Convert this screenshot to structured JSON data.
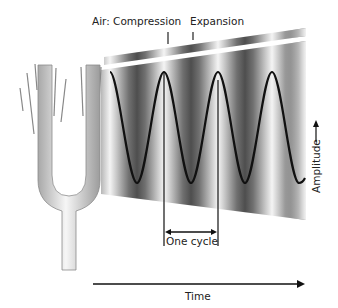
{
  "diagram": {
    "labels": {
      "compression": "Air: Compression",
      "expansion": "Expansion",
      "one_cycle": "One cycle",
      "amplitude": "Amplitude",
      "time": "Time"
    },
    "elements": {
      "source": "tuning-fork",
      "medium": "air pressure bands (compression/expansion)",
      "waveform": "sine wave",
      "cycles_shown": 4
    },
    "colors": {
      "background": "#ffffff",
      "wave_line": "#111111",
      "band_dark": "#4a4a4a",
      "band_light": "#f2f2f2",
      "fork_light": "#f4f4f4",
      "fork_dark": "#9a9a9a",
      "text": "#222222"
    }
  }
}
